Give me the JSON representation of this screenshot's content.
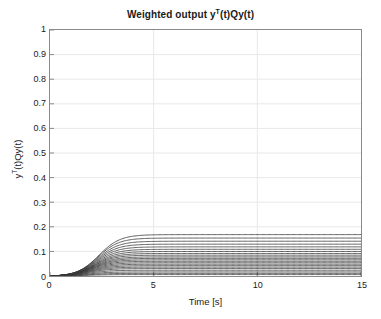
{
  "figure": {
    "width": 381,
    "height": 319,
    "background": "#ffffff",
    "axis_color": "#8a8a8a",
    "grid_color": "#e8e8e8",
    "line_color": "#3a3a3a",
    "text_color": "#1a1a1a"
  },
  "chart_data": {
    "type": "line",
    "title": "Weighted output yT(t)Qy(t)",
    "title_parts": {
      "prefix": "Weighted output y",
      "sup": "T",
      "suffix": "(t)Qy(t)"
    },
    "xlabel": "Time [s]",
    "ylabel": "yT(t)Qy(t)",
    "ylabel_parts": {
      "prefix": "y",
      "sup": "T",
      "suffix": "(t)Qy(t)"
    },
    "xlim": [
      0,
      15
    ],
    "ylim": [
      0,
      1
    ],
    "xticks": [
      0,
      5,
      10,
      15
    ],
    "xticklabels": [
      "0",
      "5",
      "10",
      "15"
    ],
    "yticks": [
      0,
      0.1,
      0.2,
      0.3,
      0.4,
      0.5,
      0.6,
      0.7,
      0.8,
      0.9,
      1
    ],
    "yticklabels": [
      "0",
      "0.1",
      "0.2",
      "0.3",
      "0.4",
      "0.5",
      "0.6",
      "0.7",
      "0.8",
      "0.9",
      "1"
    ],
    "grid": true,
    "legend": null,
    "x": [
      0,
      0.25,
      0.5,
      0.75,
      1,
      1.25,
      1.5,
      1.75,
      2,
      2.25,
      2.5,
      2.75,
      3,
      3.25,
      3.5,
      3.75,
      4,
      4.5,
      5,
      6,
      7,
      8,
      9,
      10,
      11,
      12,
      13,
      14,
      15
    ],
    "series": [
      {
        "name": "run-01",
        "plateau": 0.17,
        "t_mid": 2.35,
        "rate": 1.95,
        "values": [
          0,
          0.001,
          0.004,
          0.011,
          0.022,
          0.039,
          0.061,
          0.086,
          0.11,
          0.131,
          0.147,
          0.157,
          0.163,
          0.167,
          0.169,
          0.17,
          0.17,
          0.17,
          0.17,
          0.17,
          0.17,
          0.17,
          0.17,
          0.17,
          0.17,
          0.17,
          0.17,
          0.17,
          0.17
        ]
      },
      {
        "name": "run-02",
        "plateau": 0.156,
        "t_mid": 2.3,
        "rate": 1.95,
        "values": [
          0,
          0.001,
          0.004,
          0.011,
          0.021,
          0.037,
          0.058,
          0.081,
          0.103,
          0.122,
          0.136,
          0.145,
          0.15,
          0.153,
          0.155,
          0.156,
          0.156,
          0.156,
          0.156,
          0.156,
          0.156,
          0.156,
          0.156,
          0.156,
          0.156,
          0.156,
          0.156,
          0.156,
          0.156
        ]
      },
      {
        "name": "run-03",
        "plateau": 0.143,
        "t_mid": 2.28,
        "rate": 1.95,
        "values": [
          0,
          0.001,
          0.004,
          0.01,
          0.02,
          0.035,
          0.054,
          0.075,
          0.095,
          0.112,
          0.125,
          0.133,
          0.138,
          0.141,
          0.142,
          0.143,
          0.143,
          0.143,
          0.143,
          0.143,
          0.143,
          0.143,
          0.143,
          0.143,
          0.143,
          0.143,
          0.143,
          0.143,
          0.143
        ]
      },
      {
        "name": "run-04",
        "plateau": 0.131,
        "t_mid": 2.25,
        "rate": 1.95,
        "values": [
          0,
          0.001,
          0.003,
          0.009,
          0.018,
          0.032,
          0.05,
          0.069,
          0.087,
          0.103,
          0.114,
          0.122,
          0.126,
          0.129,
          0.13,
          0.131,
          0.131,
          0.131,
          0.131,
          0.131,
          0.131,
          0.131,
          0.131,
          0.131,
          0.131,
          0.131,
          0.131,
          0.131,
          0.131
        ]
      },
      {
        "name": "run-05",
        "plateau": 0.12,
        "t_mid": 2.22,
        "rate": 1.95,
        "values": [
          0,
          0.001,
          0.003,
          0.008,
          0.017,
          0.03,
          0.046,
          0.064,
          0.08,
          0.094,
          0.105,
          0.111,
          0.115,
          0.118,
          0.119,
          0.12,
          0.12,
          0.12,
          0.12,
          0.12,
          0.12,
          0.12,
          0.12,
          0.12,
          0.12,
          0.12,
          0.12,
          0.12,
          0.12
        ]
      },
      {
        "name": "run-06",
        "plateau": 0.11,
        "t_mid": 2.2,
        "rate": 1.95,
        "values": [
          0,
          0.001,
          0.003,
          0.008,
          0.016,
          0.028,
          0.043,
          0.059,
          0.074,
          0.086,
          0.096,
          0.102,
          0.106,
          0.108,
          0.109,
          0.11,
          0.11,
          0.11,
          0.11,
          0.11,
          0.11,
          0.11,
          0.11,
          0.11,
          0.11,
          0.11,
          0.11,
          0.11,
          0.11
        ]
      },
      {
        "name": "run-07",
        "plateau": 0.101,
        "t_mid": 2.18,
        "rate": 1.95,
        "values": [
          0,
          0.001,
          0.003,
          0.007,
          0.014,
          0.026,
          0.039,
          0.054,
          0.068,
          0.079,
          0.088,
          0.094,
          0.097,
          0.099,
          0.1,
          0.101,
          0.101,
          0.101,
          0.101,
          0.101,
          0.101,
          0.101,
          0.101,
          0.101,
          0.101,
          0.101,
          0.101,
          0.101,
          0.101
        ]
      },
      {
        "name": "run-08",
        "plateau": 0.093,
        "t_mid": 2.15,
        "rate": 1.95,
        "values": [
          0,
          0.001,
          0.002,
          0.007,
          0.013,
          0.024,
          0.036,
          0.05,
          0.062,
          0.073,
          0.081,
          0.086,
          0.089,
          0.091,
          0.092,
          0.093,
          0.093,
          0.093,
          0.093,
          0.093,
          0.093,
          0.093,
          0.093,
          0.093,
          0.093,
          0.093,
          0.093,
          0.093,
          0.093
        ]
      },
      {
        "name": "run-09",
        "plateau": 0.086,
        "t_mid": 2.12,
        "rate": 1.95,
        "values": [
          0,
          0.001,
          0.002,
          0.006,
          0.012,
          0.022,
          0.034,
          0.046,
          0.057,
          0.067,
          0.075,
          0.08,
          0.082,
          0.084,
          0.085,
          0.086,
          0.086,
          0.086,
          0.086,
          0.086,
          0.086,
          0.086,
          0.086,
          0.086,
          0.086,
          0.086,
          0.086,
          0.086,
          0.086
        ]
      },
      {
        "name": "run-10",
        "plateau": 0.079,
        "t_mid": 2.1,
        "rate": 1.95,
        "values": [
          0,
          0.001,
          0.002,
          0.006,
          0.011,
          0.02,
          0.031,
          0.042,
          0.053,
          0.062,
          0.069,
          0.073,
          0.076,
          0.077,
          0.078,
          0.079,
          0.079,
          0.079,
          0.079,
          0.079,
          0.079,
          0.079,
          0.079,
          0.079,
          0.079,
          0.079,
          0.079,
          0.079,
          0.079
        ]
      },
      {
        "name": "run-11",
        "plateau": 0.073,
        "t_mid": 2.08,
        "rate": 1.95,
        "values": [
          0,
          0.001,
          0.002,
          0.005,
          0.01,
          0.019,
          0.029,
          0.039,
          0.049,
          0.057,
          0.063,
          0.068,
          0.07,
          0.071,
          0.072,
          0.073,
          0.073,
          0.073,
          0.073,
          0.073,
          0.073,
          0.073,
          0.073,
          0.073,
          0.073,
          0.073,
          0.073,
          0.073,
          0.073
        ]
      },
      {
        "name": "run-12",
        "plateau": 0.067,
        "t_mid": 2.05,
        "rate": 1.95,
        "values": [
          0,
          0.001,
          0.002,
          0.005,
          0.01,
          0.017,
          0.026,
          0.036,
          0.045,
          0.052,
          0.058,
          0.062,
          0.064,
          0.066,
          0.066,
          0.067,
          0.067,
          0.067,
          0.067,
          0.067,
          0.067,
          0.067,
          0.067,
          0.067,
          0.067,
          0.067,
          0.067,
          0.067,
          0.067
        ]
      },
      {
        "name": "run-13",
        "plateau": 0.061,
        "t_mid": 2.02,
        "rate": 1.95,
        "values": [
          0,
          0.0,
          0.002,
          0.004,
          0.009,
          0.016,
          0.024,
          0.033,
          0.041,
          0.048,
          0.053,
          0.056,
          0.058,
          0.06,
          0.06,
          0.061,
          0.061,
          0.061,
          0.061,
          0.061,
          0.061,
          0.061,
          0.061,
          0.061,
          0.061,
          0.061,
          0.061,
          0.061,
          0.061
        ]
      },
      {
        "name": "run-14",
        "plateau": 0.055,
        "t_mid": 2.0,
        "rate": 1.95,
        "values": [
          0,
          0.0,
          0.001,
          0.004,
          0.008,
          0.014,
          0.022,
          0.03,
          0.037,
          0.043,
          0.048,
          0.051,
          0.053,
          0.054,
          0.055,
          0.055,
          0.055,
          0.055,
          0.055,
          0.055,
          0.055,
          0.055,
          0.055,
          0.055,
          0.055,
          0.055,
          0.055,
          0.055,
          0.055
        ]
      },
      {
        "name": "run-15",
        "plateau": 0.049,
        "t_mid": 1.98,
        "rate": 1.95,
        "values": [
          0,
          0.0,
          0.001,
          0.004,
          0.007,
          0.013,
          0.02,
          0.027,
          0.033,
          0.039,
          0.043,
          0.046,
          0.047,
          0.048,
          0.049,
          0.049,
          0.049,
          0.049,
          0.049,
          0.049,
          0.049,
          0.049,
          0.049,
          0.049,
          0.049,
          0.049,
          0.049,
          0.049,
          0.049
        ]
      },
      {
        "name": "run-16",
        "plateau": 0.043,
        "t_mid": 1.95,
        "rate": 1.95,
        "values": [
          0,
          0.0,
          0.001,
          0.003,
          0.006,
          0.011,
          0.017,
          0.024,
          0.029,
          0.034,
          0.038,
          0.04,
          0.042,
          0.042,
          0.043,
          0.043,
          0.043,
          0.043,
          0.043,
          0.043,
          0.043,
          0.043,
          0.043,
          0.043,
          0.043,
          0.043,
          0.043,
          0.043,
          0.043
        ]
      },
      {
        "name": "run-17",
        "plateau": 0.037,
        "t_mid": 1.92,
        "rate": 1.95,
        "values": [
          0,
          0.0,
          0.001,
          0.003,
          0.005,
          0.01,
          0.015,
          0.02,
          0.025,
          0.029,
          0.032,
          0.035,
          0.036,
          0.036,
          0.037,
          0.037,
          0.037,
          0.037,
          0.037,
          0.037,
          0.037,
          0.037,
          0.037,
          0.037,
          0.037,
          0.037,
          0.037,
          0.037,
          0.037
        ]
      },
      {
        "name": "run-18",
        "plateau": 0.031,
        "t_mid": 1.9,
        "rate": 1.95,
        "values": [
          0,
          0.0,
          0.001,
          0.002,
          0.004,
          0.008,
          0.013,
          0.017,
          0.021,
          0.024,
          0.027,
          0.029,
          0.03,
          0.031,
          0.031,
          0.031,
          0.031,
          0.031,
          0.031,
          0.031,
          0.031,
          0.031,
          0.031,
          0.031,
          0.031,
          0.031,
          0.031,
          0.031,
          0.031
        ]
      },
      {
        "name": "run-19",
        "plateau": 0.024,
        "t_mid": 1.88,
        "rate": 1.95,
        "values": [
          0,
          0.0,
          0.001,
          0.002,
          0.003,
          0.006,
          0.01,
          0.013,
          0.016,
          0.019,
          0.021,
          0.022,
          0.023,
          0.024,
          0.024,
          0.024,
          0.024,
          0.024,
          0.024,
          0.024,
          0.024,
          0.024,
          0.024,
          0.024,
          0.024,
          0.024,
          0.024,
          0.024,
          0.024
        ]
      },
      {
        "name": "run-20",
        "plateau": 0.017,
        "t_mid": 1.85,
        "rate": 1.95,
        "values": [
          0,
          0.0,
          0.0,
          0.001,
          0.002,
          0.004,
          0.007,
          0.009,
          0.012,
          0.013,
          0.015,
          0.016,
          0.016,
          0.017,
          0.017,
          0.017,
          0.017,
          0.017,
          0.017,
          0.017,
          0.017,
          0.017,
          0.017,
          0.017,
          0.017,
          0.017,
          0.017,
          0.017,
          0.017
        ]
      },
      {
        "name": "run-21",
        "plateau": 0.011,
        "t_mid": 1.82,
        "rate": 1.95,
        "values": [
          0,
          0.0,
          0.0,
          0.001,
          0.001,
          0.003,
          0.004,
          0.006,
          0.008,
          0.009,
          0.01,
          0.01,
          0.011,
          0.011,
          0.011,
          0.011,
          0.011,
          0.011,
          0.011,
          0.011,
          0.011,
          0.011,
          0.011,
          0.011,
          0.011,
          0.011,
          0.011,
          0.011,
          0.011
        ]
      },
      {
        "name": "run-22",
        "plateau": 0.006,
        "t_mid": 1.8,
        "rate": 1.95,
        "values": [
          0,
          0.0,
          0.0,
          0.0,
          0.001,
          0.001,
          0.002,
          0.003,
          0.004,
          0.005,
          0.005,
          0.006,
          0.006,
          0.006,
          0.006,
          0.006,
          0.006,
          0.006,
          0.006,
          0.006,
          0.006,
          0.006,
          0.006,
          0.006,
          0.006,
          0.006,
          0.006,
          0.006,
          0.006
        ]
      }
    ]
  }
}
